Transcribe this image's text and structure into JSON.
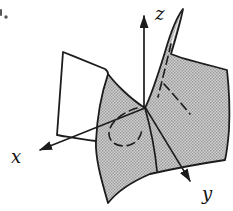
{
  "figure": {
    "kind": "saddle-surface-3d-diagram",
    "axis_labels": {
      "x": "x",
      "y": "y",
      "z": "z"
    },
    "corner_mark": "·",
    "colors": {
      "background": "#ffffff",
      "stroke": "#1c1c1c",
      "label": "#111111",
      "surface_light": "#cfcfcf",
      "surface_dot": "#989898",
      "corner_mark": "#555555"
    }
  }
}
